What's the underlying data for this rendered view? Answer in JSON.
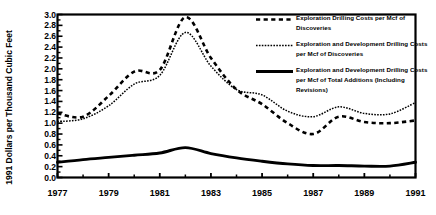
{
  "chart_data": {
    "type": "line",
    "title": "",
    "xlabel": "",
    "ylabel": "1991 Dollars per Thousand Cubic Feet",
    "xlim": [
      1977,
      1991
    ],
    "ylim": [
      0.0,
      3.0
    ],
    "grid": false,
    "legend_position": "upper-right-inside",
    "x_tick_labels": [
      "1977",
      "1979",
      "1981",
      "1983",
      "1985",
      "1987",
      "1989",
      "1991"
    ],
    "x_tick_values": [
      1977,
      1979,
      1981,
      1983,
      1985,
      1987,
      1989,
      1991
    ],
    "x_minor_tick_values": [
      1978,
      1980,
      1982,
      1984,
      1986,
      1988,
      1990
    ],
    "y_tick_labels": [
      "0.0",
      "0.2",
      "0.4",
      "0.6",
      "0.8",
      "1.0",
      "1.2",
      "1.4",
      "1.6",
      "1.8",
      "2.0",
      "2.2",
      "2.4",
      "2.6",
      "2.8",
      "3.0"
    ],
    "y_tick_values": [
      0.0,
      0.2,
      0.4,
      0.6,
      0.8,
      1.0,
      1.2,
      1.4,
      1.6,
      1.8,
      2.0,
      2.2,
      2.4,
      2.6,
      2.8,
      3.0
    ],
    "x": [
      1977,
      1978,
      1979,
      1980,
      1981,
      1982,
      1983,
      1984,
      1985,
      1986,
      1987,
      1988,
      1989,
      1990,
      1991
    ],
    "series": [
      {
        "name": "Exploration Drilling Costs per Mcf of Discoveries",
        "style": "dashed",
        "color": "#000000",
        "values": [
          1.18,
          1.12,
          1.5,
          1.95,
          1.98,
          2.95,
          2.2,
          1.62,
          1.35,
          1.0,
          0.8,
          1.12,
          1.02,
          1.0,
          1.05
        ]
      },
      {
        "name": "Exploration and Development Drilling Costs per Mcf of Discoveries",
        "style": "dotted-thin",
        "color": "#000000",
        "values": [
          1.03,
          1.08,
          1.32,
          1.72,
          1.88,
          2.67,
          2.05,
          1.62,
          1.52,
          1.22,
          1.12,
          1.3,
          1.18,
          1.17,
          1.38
        ]
      },
      {
        "name": "Exploration and Development Drilling Costs per Mcf of Total Additions (Including Revisions)",
        "style": "solid-thick",
        "color": "#000000",
        "values": [
          0.28,
          0.33,
          0.37,
          0.41,
          0.45,
          0.55,
          0.44,
          0.36,
          0.3,
          0.25,
          0.22,
          0.22,
          0.21,
          0.21,
          0.28
        ]
      }
    ]
  },
  "legend": {
    "items": [
      {
        "label": "Exploration Drilling Costs per Mcf of Discoveries",
        "style": "dashed"
      },
      {
        "label": "Exploration and Development Drilling Costs per Mcf of Discoveries",
        "style": "dotted-thin"
      },
      {
        "label": "Exploration and Development Drilling Costs per Mcf of Total Additions (Including Revisions)",
        "style": "solid-thick"
      }
    ]
  }
}
